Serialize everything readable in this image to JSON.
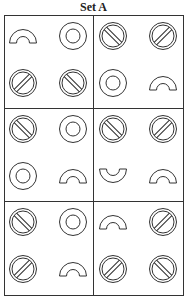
{
  "title": "Set A",
  "colors": {
    "stroke": "#333333",
    "background": "#ffffff"
  },
  "grid": {
    "rows": 3,
    "cols": 2,
    "cells": [
      {
        "row": 0,
        "col": 0,
        "shapes": [
          "arch",
          "ring",
          "no-sign-slash",
          "no-sign-backslash"
        ]
      },
      {
        "row": 0,
        "col": 1,
        "shapes": [
          "no-sign-backslash",
          "no-sign-slash",
          "ring",
          "arch"
        ]
      },
      {
        "row": 1,
        "col": 0,
        "shapes": [
          "no-sign-backslash",
          "ring",
          "ring",
          "arch"
        ]
      },
      {
        "row": 1,
        "col": 1,
        "shapes": [
          "no-sign-backslash",
          "no-sign-slash",
          "cup",
          "arch"
        ]
      },
      {
        "row": 2,
        "col": 0,
        "shapes": [
          "no-sign-backslash",
          "ring",
          "no-sign-slash",
          "arch"
        ]
      },
      {
        "row": 2,
        "col": 1,
        "shapes": [
          "arch",
          "no-sign-slash",
          "no-sign-slash",
          "no-sign-backslash"
        ]
      }
    ]
  }
}
